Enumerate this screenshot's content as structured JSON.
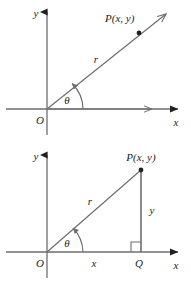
{
  "figure": {
    "stroke_color": "#6d6e71",
    "text_color": "#231f20",
    "background_color": "#ffffff"
  },
  "diagrams": [
    {
      "name": "polar-ray",
      "labels": {
        "y_axis": "y",
        "x_axis": "x",
        "origin": "O",
        "point": "P(x, y)",
        "radius": "r",
        "angle": "θ"
      }
    },
    {
      "name": "right-triangle",
      "labels": {
        "y_axis": "y",
        "x_axis": "x",
        "origin": "O",
        "point": "P(x, y)",
        "radius": "r",
        "angle": "θ",
        "adjacent": "x",
        "opposite": "y",
        "foot": "Q"
      }
    }
  ]
}
